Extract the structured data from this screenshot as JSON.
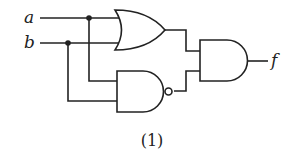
{
  "diagram": {
    "type": "logic-circuit",
    "inputs": [
      {
        "id": "a",
        "label": "a"
      },
      {
        "id": "b",
        "label": "b"
      }
    ],
    "output": {
      "id": "f",
      "label": "f"
    },
    "gates": [
      {
        "id": "g1",
        "type": "OR",
        "inputs": [
          "a",
          "b"
        ]
      },
      {
        "id": "g2",
        "type": "NAND",
        "inputs": [
          "a",
          "b"
        ]
      },
      {
        "id": "g3",
        "type": "AND",
        "inputs": [
          "g1",
          "g2"
        ],
        "output": "f"
      }
    ],
    "caption": "(1)",
    "colors": {
      "line": "#222222",
      "background": "#ffffff"
    }
  }
}
